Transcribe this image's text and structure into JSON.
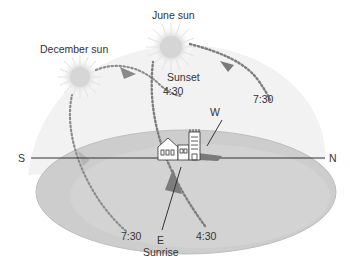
{
  "diagram": {
    "type": "sun-path",
    "labels": {
      "december_sun": "December sun",
      "june_sun": "June sun",
      "sunset": "Sunset",
      "sunrise": "Sunrise",
      "west": "W",
      "east": "E",
      "south": "S",
      "north": "N",
      "dec_sunset_time": "4:30",
      "june_sunset_time": "7:30",
      "dec_sunrise_time": "7:30",
      "june_sunrise_time": "4:30"
    },
    "colors": {
      "ground": "#c9c9c9",
      "ground_edge": "#b8b8b8",
      "sky_dome": "#eeeeee",
      "path_dots": "#8a8a8a",
      "sun_core": "#d9d9d9",
      "sun_rays": "#e6e6e6",
      "axis_line": "#333333",
      "shadow": "#7a7a7a",
      "text": "#333333"
    }
  }
}
